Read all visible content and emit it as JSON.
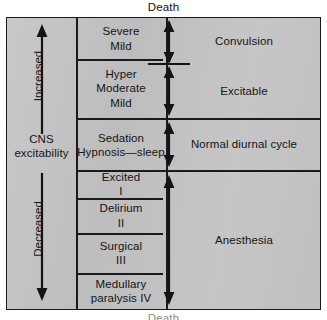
{
  "diagram": {
    "title_top": "Death",
    "title_bottom": "Death",
    "axis": {
      "name": "CNS excitability",
      "name_line1": "CNS",
      "name_line2": "excitability",
      "upper_direction_label": "Increased",
      "lower_direction_label": "Decreased"
    },
    "stage_column": [
      {
        "id": "severe-mild",
        "lines": [
          "Severe",
          "Mild"
        ]
      },
      {
        "id": "hyper-moderate-mild",
        "lines": [
          "Hyper",
          "Moderate",
          "Mild"
        ]
      },
      {
        "id": "sedation-hypnosis",
        "lines": [
          "Sedation",
          "Hypnosis—sleep"
        ]
      },
      {
        "id": "excited-i",
        "lines": [
          "Excited",
          "I"
        ]
      },
      {
        "id": "delirium-ii",
        "lines": [
          "Delirium",
          "II"
        ]
      },
      {
        "id": "surgical-iii",
        "lines": [
          "Surgical",
          "III"
        ]
      },
      {
        "id": "medullary-paralysis-iv",
        "lines": [
          "Medullary",
          "paralysis  IV"
        ]
      }
    ],
    "state_column": [
      {
        "id": "convulsion",
        "label": "Convulsion"
      },
      {
        "id": "excitable",
        "label": "Excitable"
      },
      {
        "id": "normal-diurnal-cycle",
        "label": "Normal diurnal cycle"
      },
      {
        "id": "anesthesia",
        "label": "Anesthesia"
      }
    ],
    "colors": {
      "ink": "#1a1a1a",
      "panel_fill": "#c4c4c4",
      "page_background": "#ffffff"
    }
  }
}
